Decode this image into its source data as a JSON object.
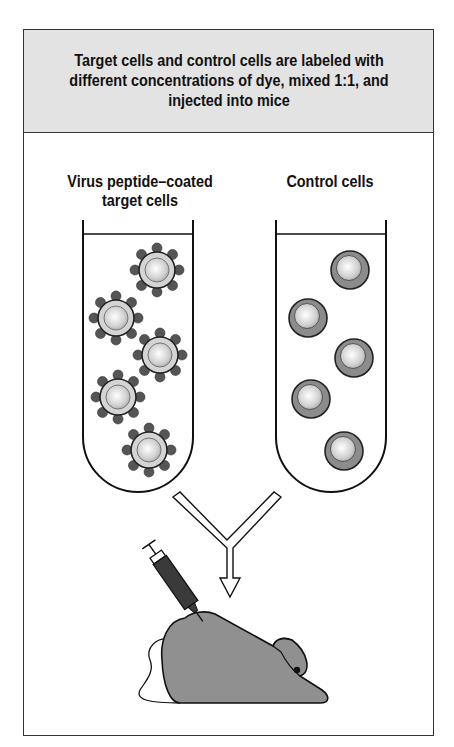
{
  "header": {
    "text": "Target cells and control cells are labeled with different concentrations of dye, mixed 1:1, and injected into mice"
  },
  "tubes": [
    {
      "label_line1": "Virus peptide–coated",
      "label_line2": "target cells",
      "cell_type": "peptide-coated-cell",
      "cell_count": 5
    },
    {
      "label_line1": "Control cells",
      "label_line2": "",
      "cell_type": "plain-cell",
      "cell_count": 5
    }
  ],
  "colors": {
    "header_bg": "#e3e3e3",
    "border": "#222222",
    "target_ring": "#d4d4d4",
    "peptide_knob": "#555555",
    "control_ring": "#8c8c8c",
    "mouse_body": "#909090",
    "syringe_barrel": "#3a3a3a"
  },
  "icons": [
    "merge-arrow-icon",
    "syringe-icon",
    "mouse-icon"
  ]
}
